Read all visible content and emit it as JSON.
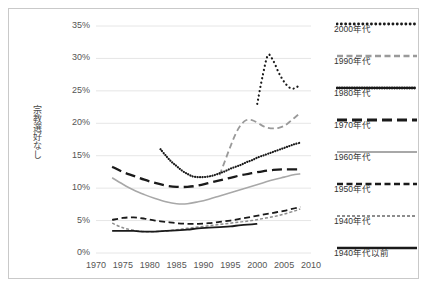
{
  "chart_data": {
    "type": "line",
    "title": "",
    "subtitle": "",
    "xlabel": "",
    "ylabel": "宗教選好なし",
    "xlim": [
      1970,
      2010
    ],
    "ylim": [
      0,
      35
    ],
    "grid": true,
    "legend_position": "right",
    "x_ticks": [
      "1970",
      "1975",
      "1980",
      "1985",
      "1990",
      "1995",
      "2000",
      "2005",
      "2010"
    ],
    "y_ticks": [
      "0%",
      "5%",
      "10%",
      "15%",
      "20%",
      "25%",
      "30%",
      "35%"
    ],
    "series": [
      {
        "name": "2000年代",
        "style": "dotted-sparse",
        "color": "#1a1a1a",
        "x": [
          2000,
          2001,
          2002,
          2003,
          2004,
          2005,
          2006,
          2007,
          2008
        ],
        "values": [
          23.0,
          27.3,
          30.5,
          29.6,
          27.8,
          26.4,
          25.5,
          25.4,
          26.0
        ]
      },
      {
        "name": "1990年代",
        "style": "dashed",
        "color": "#9a9a9a",
        "x": [
          1993,
          1994,
          1995,
          1996,
          1997,
          1998,
          1999,
          2000,
          2001,
          2002,
          2003,
          2004,
          2005,
          2006,
          2007,
          2008
        ],
        "values": [
          12.0,
          14.2,
          16.4,
          18.4,
          19.8,
          20.5,
          20.5,
          20.1,
          19.6,
          19.3,
          19.2,
          19.3,
          19.6,
          20.2,
          20.9,
          21.6
        ]
      },
      {
        "name": "1980年代",
        "style": "dotted-dense",
        "color": "#1a1a1a",
        "x": [
          1982,
          1983,
          1984,
          1985,
          1986,
          1987,
          1988,
          1989,
          1990,
          1991,
          1992,
          1993,
          1994,
          1995,
          1996,
          1997,
          1998,
          1999,
          2000,
          2001,
          2002,
          2003,
          2004,
          2005,
          2006,
          2007,
          2008
        ],
        "values": [
          16.0,
          15.0,
          14.1,
          13.4,
          12.7,
          12.2,
          11.8,
          11.7,
          11.7,
          11.8,
          12.0,
          12.3,
          12.6,
          13.0,
          13.3,
          13.6,
          14.0,
          14.3,
          14.7,
          15.0,
          15.3,
          15.6,
          15.9,
          16.2,
          16.5,
          16.8,
          17.0
        ]
      },
      {
        "name": "1970年代",
        "style": "long-dash",
        "color": "#1a1a1a",
        "x": [
          1973,
          1975,
          1977,
          1979,
          1981,
          1983,
          1985,
          1987,
          1989,
          1991,
          1993,
          1995,
          1997,
          1999,
          2001,
          2003,
          2005,
          2007,
          2008
        ],
        "values": [
          13.3,
          12.5,
          11.9,
          11.3,
          10.8,
          10.4,
          10.2,
          10.2,
          10.4,
          10.8,
          11.2,
          11.6,
          12.0,
          12.3,
          12.6,
          12.8,
          12.9,
          12.9,
          12.9
        ]
      },
      {
        "name": "1960年代",
        "style": "solid-gray",
        "color": "#a8a8a8",
        "x": [
          1973,
          1975,
          1977,
          1979,
          1981,
          1983,
          1985,
          1987,
          1989,
          1991,
          1993,
          1995,
          1997,
          1999,
          2001,
          2003,
          2005,
          2007,
          2008
        ],
        "values": [
          11.6,
          10.6,
          9.7,
          9.0,
          8.4,
          7.9,
          7.6,
          7.6,
          7.9,
          8.3,
          8.8,
          9.3,
          9.8,
          10.3,
          10.8,
          11.3,
          11.7,
          12.1,
          12.2
        ]
      },
      {
        "name": "1950年代",
        "style": "dashed",
        "color": "#1a1a1a",
        "x": [
          1973,
          1975,
          1977,
          1979,
          1981,
          1983,
          1985,
          1987,
          1989,
          1991,
          1993,
          1995,
          1997,
          1999,
          2001,
          2003,
          2005,
          2007,
          2008
        ],
        "values": [
          5.1,
          5.4,
          5.5,
          5.3,
          5.0,
          4.8,
          4.6,
          4.5,
          4.5,
          4.6,
          4.8,
          5.0,
          5.3,
          5.6,
          5.9,
          6.2,
          6.5,
          6.9,
          7.1
        ]
      },
      {
        "name": "1940年代",
        "style": "fine-dash",
        "color": "#8d8d8d",
        "x": [
          1973,
          1975,
          1977,
          1979,
          1981,
          1983,
          1985,
          1987,
          1989,
          1991,
          1993,
          1995,
          1997,
          1999,
          2001,
          2003,
          2005,
          2007,
          2008
        ],
        "values": [
          4.6,
          3.9,
          3.5,
          3.3,
          3.3,
          3.4,
          3.6,
          3.8,
          4.0,
          4.2,
          4.4,
          4.6,
          4.8,
          5.0,
          5.3,
          5.6,
          6.0,
          6.5,
          6.8
        ]
      },
      {
        "name": "1940年代以前",
        "style": "solid",
        "color": "#1a1a1a",
        "x": [
          1973,
          1975,
          1977,
          1979,
          1981,
          1983,
          1985,
          1987,
          1989,
          1991,
          1993,
          1995,
          1997,
          1999,
          2000
        ],
        "values": [
          3.4,
          3.4,
          3.4,
          3.3,
          3.3,
          3.4,
          3.5,
          3.6,
          3.8,
          3.9,
          4.0,
          4.1,
          4.3,
          4.4,
          4.5
        ]
      }
    ]
  },
  "legend": {
    "entries": [
      {
        "label": "2000年代"
      },
      {
        "label": "1990年代"
      },
      {
        "label": "1980年代"
      },
      {
        "label": "1970年代"
      },
      {
        "label": "1960年代"
      },
      {
        "label": "1950年代"
      },
      {
        "label": "1940年代"
      },
      {
        "label": "1940年代以前"
      }
    ]
  }
}
